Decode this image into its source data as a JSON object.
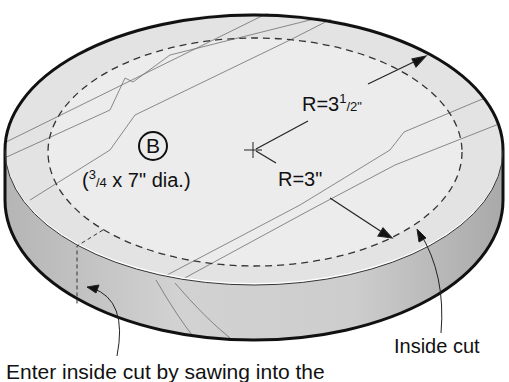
{
  "diagram": {
    "colors": {
      "background": "#ffffff",
      "top_surface": "#e6e6e6",
      "side_band": "#c4c4c4",
      "outline": "#111111",
      "grain": "#6e6e6e"
    },
    "part": {
      "letter": "B",
      "dims_open": "(",
      "dims_frac_num": "3",
      "dims_frac_den": "/4",
      "dims_rest": " x 7\" dia.)"
    },
    "labels": {
      "outer_radius_prefix": "R=3",
      "outer_radius_frac_num": "1",
      "outer_radius_frac_den": "/2\"",
      "inner_radius": "R=3\"",
      "inside_cut": "Inside cut",
      "instruction": "Enter inside cut by sawing into the"
    }
  }
}
